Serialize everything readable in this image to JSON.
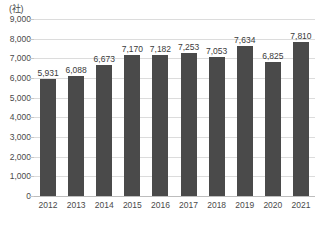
{
  "chart_data": {
    "type": "bar",
    "title": "",
    "subtitle": "",
    "unit_label": "(社)",
    "xlabel": "",
    "ylabel": "",
    "ylim": [
      0,
      9000
    ],
    "ytick_step": 1000,
    "grid": true,
    "legend": "none",
    "bar_color": "#4a4a4a",
    "gridline_color": "#dcdcdc",
    "categories": [
      "2012",
      "2013",
      "2014",
      "2015",
      "2016",
      "2017",
      "2018",
      "2019",
      "2020",
      "2021"
    ],
    "values": [
      5931,
      6088,
      6673,
      7170,
      7182,
      7253,
      7053,
      7634,
      6825,
      7810
    ],
    "value_labels": [
      "5,931",
      "6,088",
      "6,673",
      "7,170",
      "7,182",
      "7,253",
      "7,053",
      "7,634",
      "6,825",
      "7,810"
    ],
    "ytick_labels": [
      "9,000",
      "8,000",
      "7,000",
      "6,000",
      "5,000",
      "4,000",
      "3,000",
      "2,000",
      "1,000",
      "0"
    ],
    "ytick_values": [
      9000,
      8000,
      7000,
      6000,
      5000,
      4000,
      3000,
      2000,
      1000,
      0
    ]
  }
}
